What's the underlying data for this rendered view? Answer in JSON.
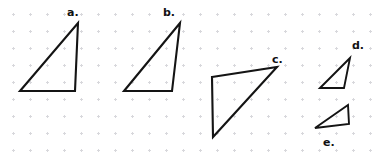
{
  "figure": {
    "width": 386,
    "height": 156,
    "background_color": "#ffffff",
    "grid": {
      "style": "dotted",
      "dot_color": "#d8d8dc",
      "spacing_px": 17,
      "origin_x": 5,
      "origin_y": 6
    },
    "stroke_color": "#141414",
    "label_color": "#111111"
  },
  "shapes": [
    {
      "id": "a",
      "label": "a.",
      "type": "triangle",
      "label_x": 67,
      "label_y": 7,
      "points": "20,91 78,23 75,91 20,91",
      "vertices": [
        [
          20,
          91
        ],
        [
          78,
          23
        ],
        [
          75,
          91
        ]
      ]
    },
    {
      "id": "b",
      "label": "b.",
      "type": "triangle",
      "label_x": 163,
      "label_y": 7,
      "points": "124,91 180,23 172,91 124,91",
      "vertices": [
        [
          124,
          91
        ],
        [
          180,
          23
        ],
        [
          172,
          91
        ]
      ]
    },
    {
      "id": "c",
      "label": "c.",
      "type": "triangle",
      "label_x": 272,
      "label_y": 54,
      "points": "212,77 277,67 213,137 212,77",
      "vertices": [
        [
          212,
          77
        ],
        [
          277,
          67
        ],
        [
          213,
          137
        ]
      ]
    },
    {
      "id": "d",
      "label": "d.",
      "type": "triangle",
      "label_x": 352,
      "label_y": 40,
      "points": "320,88 350,58 344,88 320,88",
      "vertices": [
        [
          320,
          88
        ],
        [
          350,
          58
        ],
        [
          344,
          88
        ]
      ]
    },
    {
      "id": "e",
      "label": "e.",
      "type": "triangle",
      "label_x": 323,
      "label_y": 137,
      "points": "315,128 348,105 349,124 315,128",
      "vertices": [
        [
          315,
          128
        ],
        [
          348,
          105
        ],
        [
          349,
          124
        ]
      ]
    }
  ]
}
